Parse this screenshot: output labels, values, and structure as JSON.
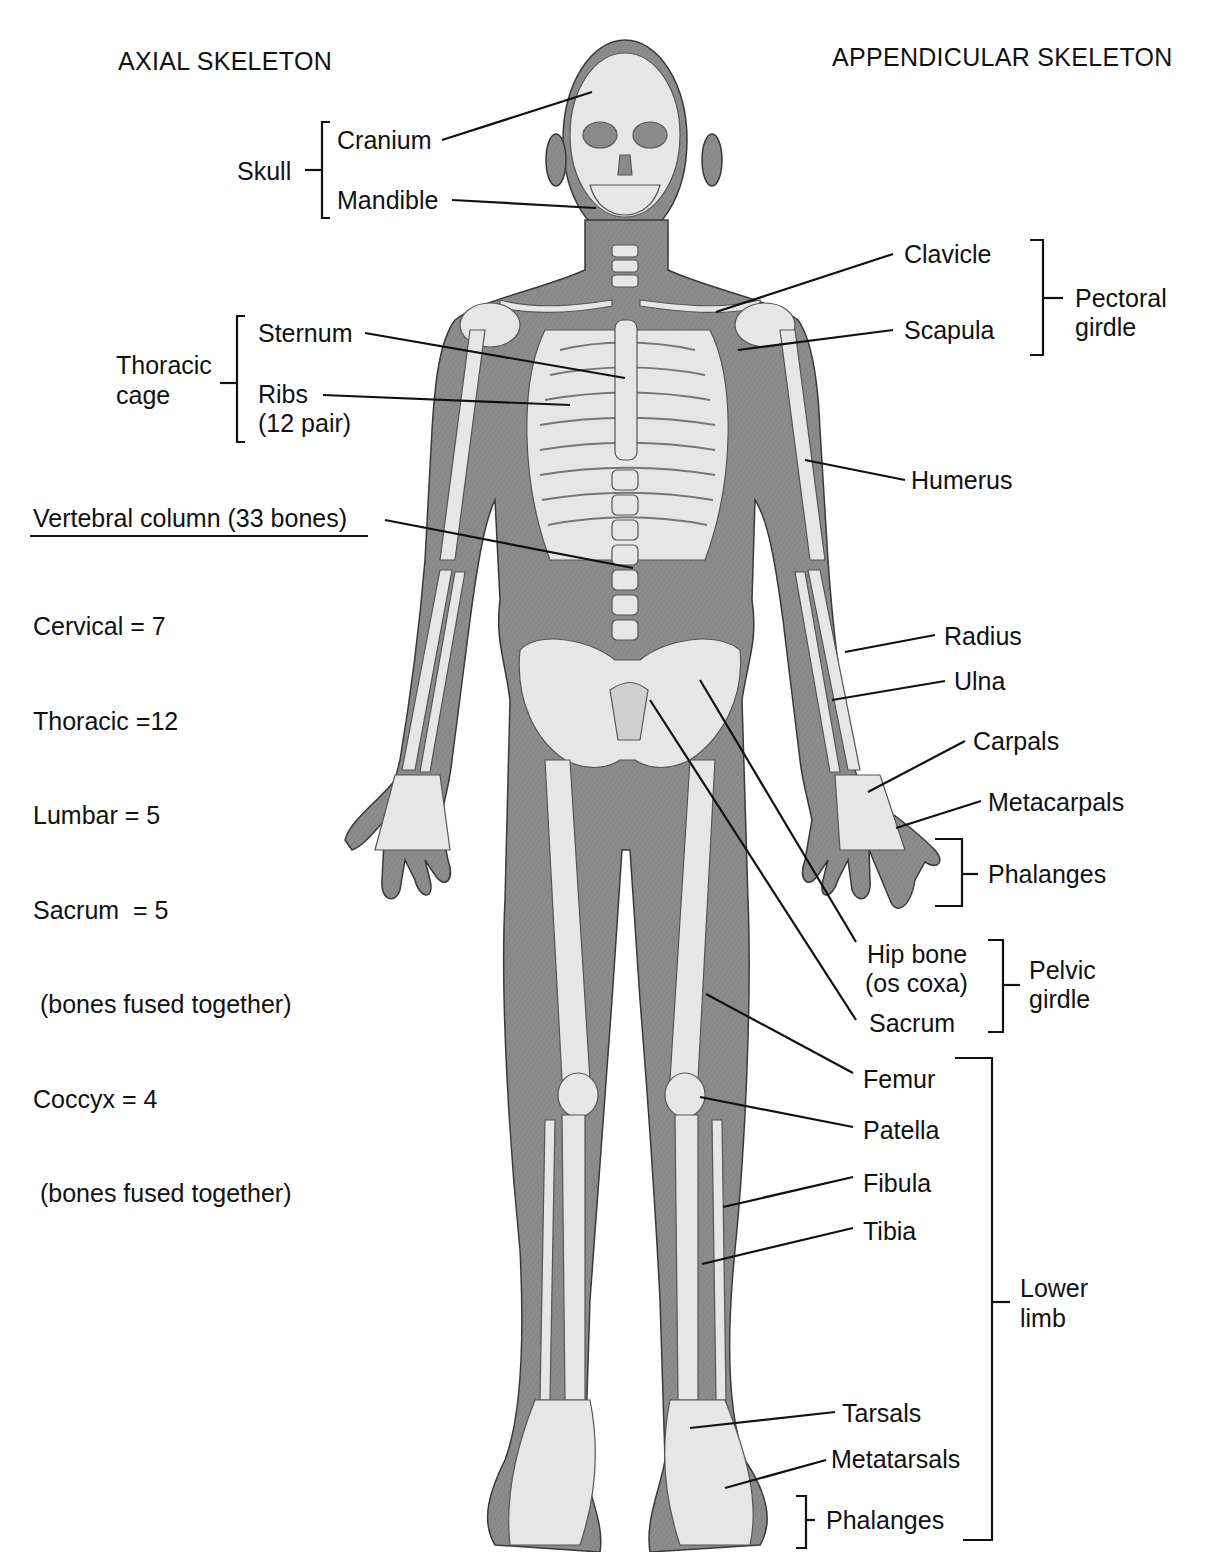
{
  "headers": {
    "left": "AXIAL SKELETON",
    "right": "APPENDICULAR SKELETON"
  },
  "colors": {
    "body_fill": "#8a8a8a",
    "bone_fill": "#e4e4e4",
    "line": "#111111",
    "background": "#ffffff"
  },
  "axial": {
    "skull": {
      "group": "Skull",
      "parts": [
        "Cranium",
        "Mandible"
      ]
    },
    "thoracic_cage": {
      "group_line1": "Thoracic",
      "group_line2": "cage",
      "parts": [
        "Sternum",
        "Ribs",
        "(12 pair)"
      ]
    },
    "vertebral_column": {
      "title": "Vertebral column (33 bones)",
      "lines": [
        "Cervical = 7",
        "Thoracic =12",
        "Lumbar = 5",
        "Sacrum  = 5",
        " (bones fused together)",
        "Coccyx = 4",
        " (bones fused together)"
      ]
    }
  },
  "appendicular": {
    "pectoral_girdle": {
      "group_line1": "Pectoral",
      "group_line2": "girdle",
      "parts": [
        "Clavicle",
        "Scapula"
      ]
    },
    "upper_limb": [
      "Humerus",
      "Radius",
      "Ulna",
      "Carpals",
      "Metacarpals",
      "Phalanges"
    ],
    "pelvic_girdle": {
      "group_line1": "Pelvic",
      "group_line2": "girdle",
      "parts": [
        "Hip bone",
        "(os coxa)",
        "Sacrum"
      ]
    },
    "lower_limb": {
      "group_line1": "Lower",
      "group_line2": "limb",
      "parts": [
        "Femur",
        "Patella",
        "Fibula",
        "Tibia",
        "Tarsals",
        "Metatarsals",
        "Phalanges"
      ]
    }
  }
}
